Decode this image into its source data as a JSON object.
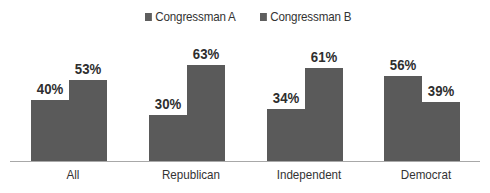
{
  "chart_data": {
    "type": "bar",
    "title": "",
    "xlabel": "",
    "ylabel": "",
    "categories": [
      "All",
      "Republican",
      "Independent",
      "Democrat"
    ],
    "series": [
      {
        "name": "Congressman A",
        "values": [
          40,
          30,
          34,
          56
        ],
        "labels": [
          "40%",
          "30%",
          "34%",
          "56%"
        ],
        "color": "#5a5a5a"
      },
      {
        "name": "Congressman B",
        "values": [
          53,
          63,
          61,
          39
        ],
        "labels": [
          "53%",
          "63%",
          "61%",
          "39%"
        ],
        "color": "#5a5a5a"
      }
    ],
    "ylim": [
      0,
      70
    ],
    "grid": false,
    "legend_position": "top"
  },
  "legend": [
    {
      "label": "Congressman A"
    },
    {
      "label": "Congressman B"
    }
  ]
}
